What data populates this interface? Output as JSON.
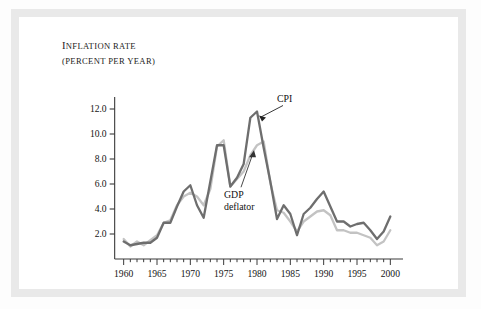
{
  "figure": {
    "axis_title_line1": "Inflation rate",
    "axis_title_line2": "(percent per year)",
    "series_label_cpi": "CPI",
    "series_label_deflator_line1": "GDP",
    "series_label_deflator_line2": "deflator"
  },
  "colors": {
    "cpi": "#6e6e6e",
    "deflator": "#c3c3c3",
    "axis": "#3a3a3a",
    "frame": "#e9e9e9",
    "page": "#fdfdfd",
    "text": "#151515"
  },
  "chart_data": {
    "type": "line",
    "title": "Inflation rate (percent per year)",
    "xlabel": "",
    "ylabel": "Inflation rate (percent per year)",
    "xlim": [
      1959,
      2001
    ],
    "ylim": [
      0,
      12.8
    ],
    "yticks": [
      "2.0",
      "4.0",
      "6.0",
      "8.0",
      "10.0",
      "12.0"
    ],
    "ytick_values": [
      2.0,
      4.0,
      6.0,
      8.0,
      10.0,
      12.0
    ],
    "xticks": [
      "1960",
      "1965",
      "1970",
      "1975",
      "1980",
      "1985",
      "1990",
      "1995",
      "2000"
    ],
    "xtick_values": [
      1960,
      1965,
      1970,
      1975,
      1980,
      1985,
      1990,
      1995,
      2000
    ],
    "minor_xtick_interval": 1,
    "grid": false,
    "legend": "annotated-on-curve",
    "x": [
      1960,
      1961,
      1962,
      1963,
      1964,
      1965,
      1966,
      1967,
      1968,
      1969,
      1970,
      1971,
      1972,
      1973,
      1974,
      1975,
      1976,
      1977,
      1978,
      1979,
      1980,
      1981,
      1982,
      1983,
      1984,
      1985,
      1986,
      1987,
      1988,
      1989,
      1990,
      1991,
      1992,
      1993,
      1994,
      1995,
      1996,
      1997,
      1998,
      1999,
      2000
    ],
    "series": [
      {
        "name": "CPI",
        "color": "#6e6e6e",
        "values": [
          1.4,
          1.1,
          1.2,
          1.3,
          1.3,
          1.7,
          2.9,
          2.9,
          4.2,
          5.4,
          5.9,
          4.3,
          3.3,
          6.2,
          9.1,
          9.1,
          5.8,
          6.5,
          7.6,
          11.3,
          11.8,
          8.9,
          6.2,
          3.2,
          4.3,
          3.6,
          1.9,
          3.6,
          4.1,
          4.8,
          5.4,
          4.2,
          3.0,
          3.0,
          2.6,
          2.8,
          2.9,
          2.3,
          1.6,
          2.2,
          3.4
        ]
      },
      {
        "name": "GDP deflator",
        "color": "#c3c3c3",
        "values": [
          1.6,
          1.0,
          1.4,
          1.1,
          1.5,
          1.9,
          2.9,
          3.1,
          4.3,
          5.0,
          5.3,
          5.0,
          4.3,
          5.6,
          9.0,
          9.5,
          5.8,
          6.4,
          7.0,
          8.3,
          9.1,
          9.4,
          6.1,
          3.9,
          3.7,
          3.0,
          2.2,
          3.0,
          3.4,
          3.8,
          3.9,
          3.5,
          2.3,
          2.3,
          2.1,
          2.1,
          1.9,
          1.7,
          1.1,
          1.4,
          2.3
        ]
      }
    ],
    "annotations": [
      {
        "text": "CPI",
        "series": "CPI",
        "points_to_year": 1980
      },
      {
        "text": "GDP deflator",
        "series": "GDP deflator",
        "points_to_year": 1980
      }
    ]
  }
}
